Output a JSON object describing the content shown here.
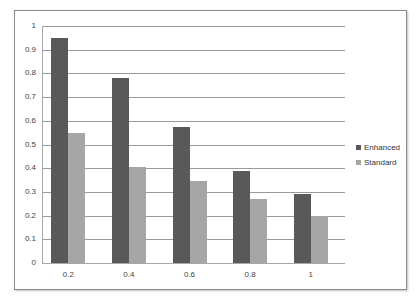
{
  "chart_data": {
    "type": "bar",
    "title": "",
    "xlabel": "",
    "ylabel": "",
    "categories": [
      "0.2",
      "0.4",
      "0.6",
      "0.8",
      "1"
    ],
    "series": [
      {
        "name": "Enhanced",
        "color": "#595959",
        "values": [
          0.95,
          0.78,
          0.575,
          0.39,
          0.29
        ]
      },
      {
        "name": "Standard",
        "color": "#a6a6a6",
        "values": [
          0.55,
          0.405,
          0.345,
          0.27,
          0.2
        ]
      }
    ],
    "ylim": [
      0,
      1
    ],
    "yticks": [
      "0",
      "0.1",
      "0.2",
      "0.3",
      "0.4",
      "0.5",
      "0.6",
      "0.7",
      "0.8",
      "0.9",
      "1"
    ],
    "grid": true,
    "legend_position": "right"
  }
}
